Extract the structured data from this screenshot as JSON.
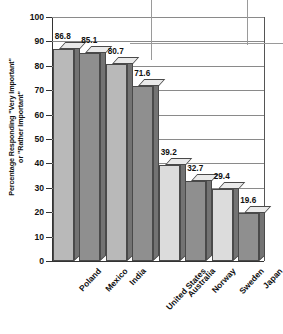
{
  "chart_data": {
    "type": "bar",
    "title": "",
    "xlabel": "",
    "ylabel": "Percentage Responding \"Very Important\"\nor \"Rather Important\"",
    "categories": [
      "Poland",
      "Mexico",
      "India",
      "United States",
      "Australia",
      "Norway",
      "Sweden",
      "Japan"
    ],
    "values": [
      86.8,
      85.1,
      80.7,
      71.6,
      39.2,
      32.7,
      29.4,
      19.6
    ],
    "value_labels": [
      "86.8",
      "85.1",
      "80.7",
      "71.6",
      "39.2",
      "32.7",
      "29.4",
      "19.6"
    ],
    "ylim": [
      0,
      100
    ],
    "yticks": [
      0,
      10,
      20,
      30,
      40,
      50,
      60,
      70,
      80,
      90,
      100
    ],
    "ytick_labels": [
      "0",
      "10",
      "20",
      "30",
      "40",
      "50",
      "60",
      "70",
      "80",
      "90",
      "100"
    ],
    "grid": true,
    "legend": "none",
    "bar_shades": [
      "light",
      "dark",
      "light",
      "dark",
      "light",
      "dark",
      "light",
      "dark"
    ]
  },
  "colors": {
    "bar_light": "#b9b9b9",
    "bar_lighter": "#dcdcdc",
    "bar_dark": "#8f8f8f",
    "bar_top": "#eaeaea",
    "bar_side": "#737373",
    "outline": "#4a4a4a",
    "gridline": "#8a8a8a",
    "axis": "#333333",
    "text": "#111111",
    "background": "#ffffff"
  }
}
